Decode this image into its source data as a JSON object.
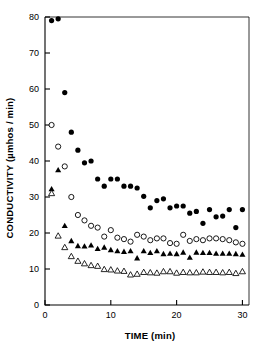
{
  "chart_data": {
    "type": "scatter",
    "title": "",
    "xlabel": "TIME (min)",
    "ylabel": "CONDUCTIVITY (µmhos / min)",
    "xlim": [
      0,
      31
    ],
    "ylim": [
      0,
      80
    ],
    "xticks": [
      0,
      10,
      20,
      30
    ],
    "yticks": [
      0,
      10,
      20,
      30,
      40,
      50,
      60,
      70,
      80
    ],
    "grid": false,
    "legend_position": "none",
    "frame": "box",
    "series": [
      {
        "name": "filled-circle",
        "marker": "filled-circle",
        "color": "#000000",
        "x": [
          1,
          2,
          3,
          4,
          5,
          6,
          7,
          8,
          9,
          10,
          11,
          12,
          13,
          14,
          15,
          16,
          17,
          18,
          19,
          20,
          21,
          22,
          23,
          24,
          25,
          26,
          27,
          28,
          29,
          30
        ],
        "values": [
          79.0,
          79.5,
          59.0,
          48.0,
          43.0,
          39.5,
          40.0,
          35.0,
          33.0,
          35.0,
          35.0,
          33.0,
          33.0,
          32.5,
          30.2,
          27.0,
          29.0,
          29.5,
          27.0,
          27.5,
          27.5,
          25.5,
          26.0,
          22.7,
          26.5,
          24.5,
          24.7,
          26.5,
          21.5,
          26.5
        ]
      },
      {
        "name": "open-circle",
        "marker": "open-circle",
        "color": "#000000",
        "x": [
          1,
          2,
          3,
          4,
          5,
          6,
          7,
          8,
          9,
          10,
          11,
          12,
          13,
          14,
          15,
          16,
          17,
          18,
          19,
          20,
          21,
          22,
          23,
          24,
          25,
          26,
          27,
          28,
          29,
          30
        ],
        "values": [
          50.0,
          44.0,
          38.5,
          30.0,
          25.0,
          23.5,
          22.0,
          21.5,
          19.0,
          20.8,
          18.7,
          18.3,
          17.6,
          19.5,
          19.0,
          18.0,
          18.5,
          18.5,
          17.2,
          17.0,
          19.5,
          17.8,
          18.3,
          18.0,
          18.5,
          18.5,
          18.3,
          18.0,
          17.4,
          17.0
        ]
      },
      {
        "name": "filled-triangle",
        "marker": "filled-triangle",
        "color": "#000000",
        "x": [
          1,
          2,
          3,
          4,
          5,
          6,
          7,
          8,
          9,
          10,
          11,
          12,
          13,
          14,
          15,
          16,
          17,
          18,
          19,
          20,
          21,
          22,
          23,
          24,
          25,
          26,
          27,
          28,
          29,
          30
        ],
        "values": [
          32.2,
          37.5,
          22.0,
          17.8,
          16.4,
          16.3,
          16.6,
          15.6,
          16.0,
          15.3,
          15.0,
          14.8,
          15.0,
          13.0,
          15.0,
          14.5,
          15.0,
          14.2,
          14.3,
          14.2,
          14.6,
          13.2,
          14.6,
          14.5,
          14.5,
          14.3,
          14.3,
          14.3,
          14.2,
          14.0
        ]
      },
      {
        "name": "open-triangle",
        "marker": "open-triangle",
        "color": "#000000",
        "x": [
          1,
          2,
          3,
          4,
          5,
          6,
          7,
          8,
          9,
          10,
          11,
          12,
          13,
          14,
          15,
          16,
          17,
          18,
          19,
          20,
          21,
          22,
          23,
          24,
          25,
          26,
          27,
          28,
          29,
          30
        ],
        "values": [
          31.0,
          19.2,
          16.0,
          13.5,
          12.2,
          11.5,
          11.0,
          10.8,
          9.9,
          9.8,
          9.5,
          9.4,
          8.4,
          8.6,
          9.1,
          9.0,
          8.9,
          9.3,
          9.3,
          8.9,
          9.1,
          9.0,
          9.0,
          9.2,
          9.1,
          9.1,
          9.0,
          9.1,
          8.8,
          9.3
        ]
      }
    ]
  },
  "axes": {
    "x_tick_labels": [
      "0",
      "10",
      "20",
      "30"
    ],
    "y_tick_labels": [
      "0",
      "10",
      "20",
      "30",
      "40",
      "50",
      "60",
      "70",
      "80"
    ],
    "x_axis_title": "TIME (min)",
    "y_axis_title": "CONDUCTIVITY (µmhos / min)"
  },
  "colors": {
    "axis": "#000000",
    "marker": "#000000",
    "background": "#ffffff"
  }
}
